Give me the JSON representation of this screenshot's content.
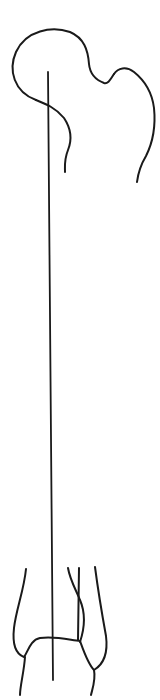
{
  "diagram": {
    "type": "anatomical-line-drawing",
    "colors": {
      "background": "#ffffff",
      "stroke": "#1a1a1a"
    },
    "parts": {
      "femoral_head": "M 36 100 C 14 92, 8 70, 16 52 C 26 30, 52 26, 70 32 C 84 38, 88 50, 89 64 C 90 74, 96 80, 104 83 C 108 84, 110 80, 114 74",
      "femoral_neck_lower": "M 36 100 C 46 104, 56 108, 64 118 C 72 130, 72 140, 68 150 C 64 160, 65 166, 65 172",
      "greater_trochanter": "M 114 74 C 118 68, 126 66, 134 72 C 144 80, 152 92, 154 108 C 156 128, 152 144, 146 156 C 140 166, 138 174, 137 182",
      "axis_line": "M 48 72 L 53 680",
      "medial_condyle": "M 26 569 C 24 590, 16 610, 14 628 C 12 646, 16 654, 24 657 C 28 652, 30 640, 40 638 C 56 636, 70 640, 80 641",
      "medial_tail": "M 25 657 C 24 672, 20 686, 20 695",
      "intercondylar_left": "M 68 568 C 70 580, 76 590, 80 600 C 86 614, 84 630, 80 642",
      "intercondylar_right": "M 79 568 L 78 640",
      "lateral_condyle": "M 80 641 C 84 652, 88 664, 94 670 C 104 664, 108 652, 106 636 C 102 614, 98 590, 95 567",
      "lateral_tail": "M 94 670 C 96 680, 92 690, 91 695"
    }
  }
}
